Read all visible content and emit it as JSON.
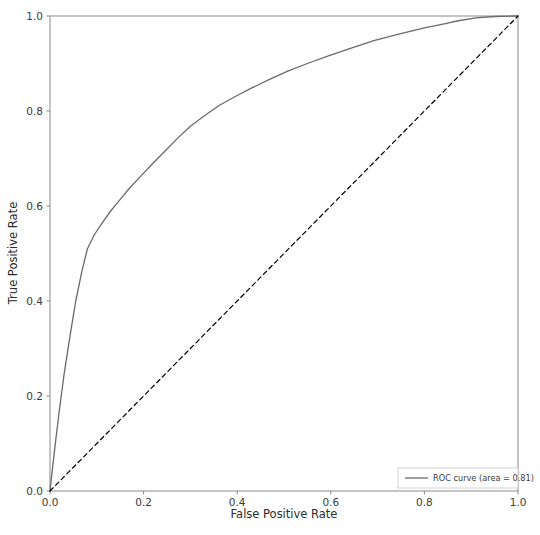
{
  "chart_data": {
    "type": "line",
    "title": "",
    "title_clipped": true,
    "xlabel": "False Positive Rate",
    "ylabel": "True Positive Rate",
    "xlim": [
      0.0,
      1.0
    ],
    "ylim": [
      0.0,
      1.0
    ],
    "xticks": [
      "0.0",
      "0.2",
      "0.4",
      "0.6",
      "0.8",
      "1.0"
    ],
    "xtick_values": [
      0.0,
      0.2,
      0.4,
      0.6,
      0.8,
      1.0
    ],
    "yticks": [
      "0.0",
      "0.2",
      "0.4",
      "0.6",
      "0.8",
      "1.0"
    ],
    "ytick_values": [
      0.0,
      0.2,
      0.4,
      0.6,
      0.8,
      1.0
    ],
    "grid": false,
    "legend_position": "lower right",
    "auc": 0.81,
    "series": [
      {
        "name": "ROC curve (area = 0.81)",
        "color": "#6a6a6a",
        "linestyle": "solid",
        "linewidth": 1.3,
        "x": [
          0.0,
          0.005,
          0.012,
          0.02,
          0.03,
          0.042,
          0.055,
          0.068,
          0.08,
          0.095,
          0.112,
          0.13,
          0.15,
          0.172,
          0.195,
          0.22,
          0.248,
          0.275,
          0.3,
          0.33,
          0.362,
          0.395,
          0.43,
          0.468,
          0.508,
          0.55,
          0.595,
          0.642,
          0.692,
          0.745,
          0.8,
          0.845,
          0.872,
          0.91,
          0.95,
          1.0
        ],
        "y": [
          0.0,
          0.045,
          0.105,
          0.17,
          0.245,
          0.322,
          0.4,
          0.462,
          0.51,
          0.54,
          0.565,
          0.59,
          0.614,
          0.64,
          0.664,
          0.69,
          0.718,
          0.745,
          0.768,
          0.79,
          0.812,
          0.83,
          0.848,
          0.866,
          0.884,
          0.9,
          0.916,
          0.932,
          0.948,
          0.962,
          0.975,
          0.984,
          0.99,
          0.996,
          0.999,
          1.0
        ]
      },
      {
        "name": "chance-diagonal",
        "color": "#000000",
        "linestyle": "dashed",
        "linewidth": 1.2,
        "x": [
          0.0,
          1.0
        ],
        "y": [
          0.0,
          1.0
        ]
      }
    ],
    "legend_entries": [
      {
        "label": "ROC curve (area = 0.81)",
        "color": "#6a6a6a",
        "linestyle": "solid"
      }
    ]
  },
  "axes": {
    "spine_color": "#8a8a8a",
    "tick_color": "#8a8a8a"
  }
}
